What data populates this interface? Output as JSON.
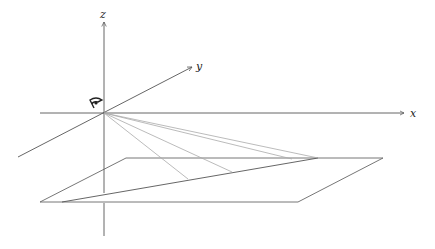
{
  "diagram": {
    "axes": {
      "x_label": "x",
      "y_label": "y",
      "z_label": "z"
    },
    "viewpoint_icon": "eye-icon",
    "colors": {
      "axis": "#555555",
      "plane": "#666666",
      "ray": "#aaaaaa",
      "background": "#ffffff"
    },
    "elements": [
      "3D coordinate axes x, y, z",
      "eye at origin",
      "ground plane (parallelogram)",
      "line on plane",
      "projection rays from eye to points on line"
    ]
  }
}
